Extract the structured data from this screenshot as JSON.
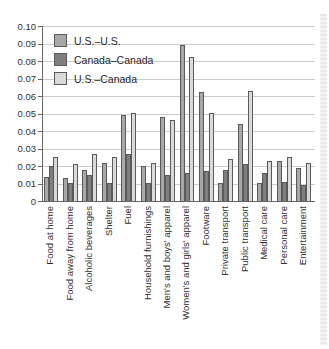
{
  "chart_data": {
    "type": "bar",
    "title": "",
    "xlabel": "",
    "ylabel": "",
    "ylim": [
      0,
      0.1
    ],
    "ytick_step": 0.01,
    "ytick_labels": [
      "0.10",
      "0.09",
      "0.08",
      "0.07",
      "0.06",
      "0.05",
      "0.04",
      "0.03",
      "0.02",
      "0.01",
      "0"
    ],
    "grid": true,
    "legend_position": "top-left-inside",
    "categories": [
      "Food at home",
      "Food away from home",
      "Alcoholic beverages",
      "Shelter",
      "Fuel",
      "Household furnishings",
      "Men's and boys' apparel",
      "Women's and girls' apparel",
      "Footware",
      "Private transport",
      "Public transport",
      "Medical care",
      "Personal care",
      "Entertainment"
    ],
    "series": [
      {
        "name": "U.S.–U.S.",
        "color": "#a8a8a8",
        "values": [
          0.014,
          0.013,
          0.018,
          0.022,
          0.049,
          0.02,
          0.048,
          0.089,
          0.062,
          0.01,
          0.044,
          0.01,
          0.023,
          0.019
        ]
      },
      {
        "name": "Canada–Canada",
        "color": "#7f7f7f",
        "values": [
          0.02,
          0.01,
          0.015,
          0.01,
          0.027,
          0.01,
          0.015,
          0.016,
          0.017,
          0.018,
          0.021,
          0.016,
          0.011,
          0.009
        ]
      },
      {
        "name": "U.S.–Canada",
        "color": "#d9d9d9",
        "values": [
          0.025,
          0.021,
          0.027,
          0.025,
          0.05,
          0.022,
          0.046,
          0.082,
          0.05,
          0.024,
          0.063,
          0.023,
          0.025,
          0.022
        ]
      }
    ]
  },
  "colors": {
    "bar_border": "#5a5a5a",
    "gridline": "#cccccc",
    "axis": "#666666",
    "text": "#303030",
    "background": "#ffffff"
  }
}
